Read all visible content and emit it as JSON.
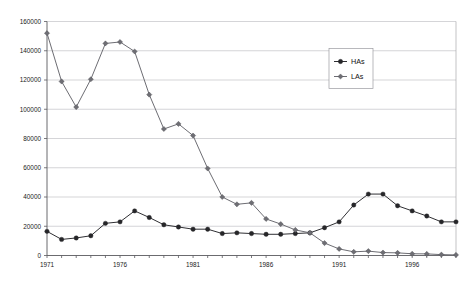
{
  "chart_data": {
    "type": "line",
    "title": "",
    "subtitle": "",
    "xlabel": "",
    "ylabel": "",
    "grid": true,
    "legend_position": "upper-right",
    "ylim": [
      0,
      160000
    ],
    "ytick_labels": [
      "0",
      "20000",
      "40000",
      "60000",
      "80000",
      "100000",
      "120000",
      "140000",
      "160000"
    ],
    "ytick_values": [
      0,
      20000,
      40000,
      60000,
      80000,
      100000,
      120000,
      140000,
      160000
    ],
    "xlim": [
      1971,
      1999
    ],
    "xtick_labels": [
      "1971",
      "1976",
      "1981",
      "1986",
      "1991",
      "1996"
    ],
    "xtick_values": [
      1971,
      1976,
      1981,
      1986,
      1991,
      1996
    ],
    "x": [
      1971,
      1972,
      1973,
      1974,
      1975,
      1976,
      1977,
      1978,
      1979,
      1980,
      1981,
      1982,
      1983,
      1984,
      1985,
      1986,
      1987,
      1988,
      1989,
      1990,
      1991,
      1992,
      1993,
      1994,
      1995,
      1996,
      1997,
      1998,
      1999
    ],
    "series": [
      {
        "name": "HAs",
        "marker": "circle",
        "color": "#262629",
        "values": [
          16500,
          11000,
          12000,
          13500,
          22000,
          23000,
          30500,
          26000,
          21000,
          19500,
          18000,
          18000,
          15000,
          15500,
          15000,
          14500,
          14500,
          15000,
          15500,
          19000,
          23000,
          34500,
          42000,
          42000,
          34000,
          30500,
          27000,
          23000,
          23000
        ]
      },
      {
        "name": "LAs",
        "marker": "diamond",
        "color": "#6e6e74",
        "values": [
          152000,
          119000,
          101500,
          120500,
          145000,
          146000,
          139500,
          110000,
          86500,
          90000,
          82000,
          59500,
          40000,
          35000,
          36000,
          25000,
          21500,
          17500,
          15500,
          8500,
          4500,
          2500,
          3000,
          2000,
          1800,
          1200,
          1100,
          600,
          400
        ]
      }
    ]
  },
  "legend": {
    "entries": [
      {
        "label": "HAs"
      },
      {
        "label": "LAs"
      }
    ]
  }
}
